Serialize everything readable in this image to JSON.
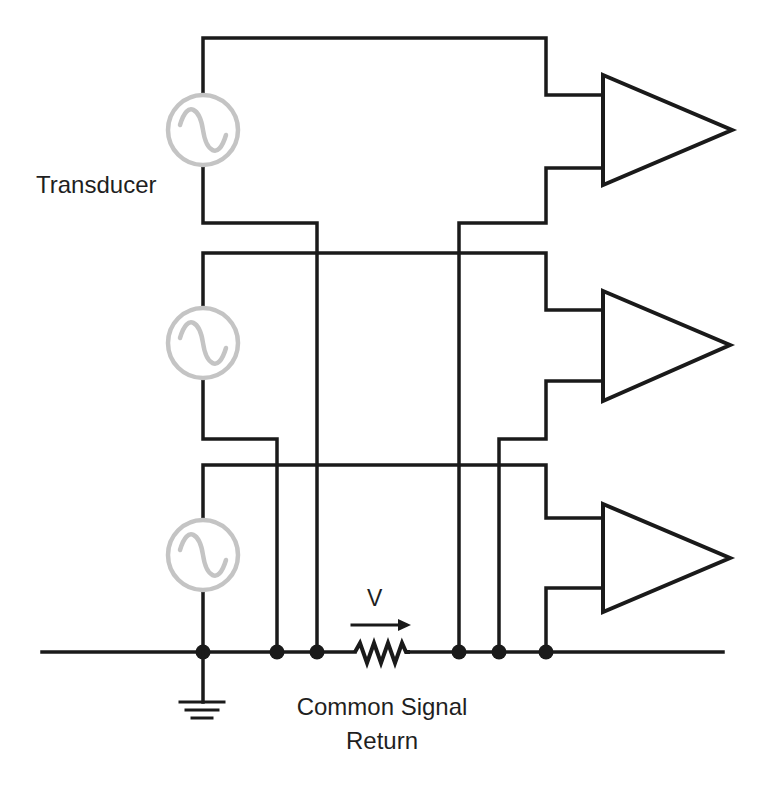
{
  "diagram": {
    "type": "circuit-schematic",
    "labels": {
      "transducer": "Transducer",
      "voltage": "V",
      "common_return_line1": "Common Signal",
      "common_return_line2": "Return"
    },
    "components": {
      "sources": [
        {
          "id": "source-1",
          "symbol": "ac-sine-source",
          "label": "Transducer"
        },
        {
          "id": "source-2",
          "symbol": "ac-sine-source",
          "label": ""
        },
        {
          "id": "source-3",
          "symbol": "ac-sine-source",
          "label": ""
        }
      ],
      "amplifiers": [
        {
          "id": "amplifier-1",
          "symbol": "triangle",
          "inputs": 2
        },
        {
          "id": "amplifier-2",
          "symbol": "triangle",
          "inputs": 2
        },
        {
          "id": "amplifier-3",
          "symbol": "triangle",
          "inputs": 2
        }
      ],
      "resistor": {
        "id": "return-impedance",
        "symbol": "zigzag-resistor",
        "arrow_label": "V"
      },
      "ground": {
        "id": "ground",
        "symbol": "earth-ground"
      },
      "junctions": 6
    },
    "colors": {
      "wire": "#1a1a1a",
      "source_symbol": "#c4c4c4",
      "background": "#ffffff",
      "text": "#1f1f1f"
    }
  }
}
